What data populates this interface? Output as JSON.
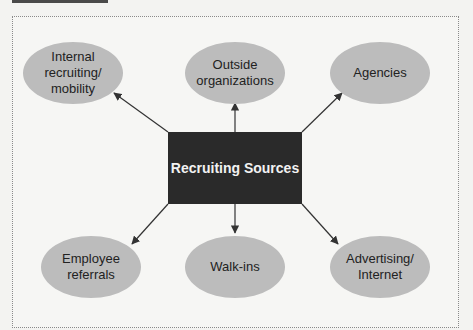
{
  "diagram": {
    "center": {
      "label": "Recruiting Sources"
    },
    "nodes": [
      {
        "id": "internal",
        "label": "Internal\nrecruiting/\nmobility",
        "position": "top-left"
      },
      {
        "id": "outside",
        "label": "Outside\norganizations",
        "position": "top-center"
      },
      {
        "id": "agencies",
        "label": "Agencies",
        "position": "top-right"
      },
      {
        "id": "referrals",
        "label": "Employee\nreferrals",
        "position": "bottom-left"
      },
      {
        "id": "walkins",
        "label": "Walk-ins",
        "position": "bottom-center"
      },
      {
        "id": "advertising",
        "label": "Advertising/\nInternet",
        "position": "bottom-right"
      }
    ],
    "colors": {
      "ellipse_fill": "#bcbcbc",
      "center_fill": "#2a2a2a",
      "center_text": "#f2f2f2",
      "arrow": "#333333"
    }
  }
}
